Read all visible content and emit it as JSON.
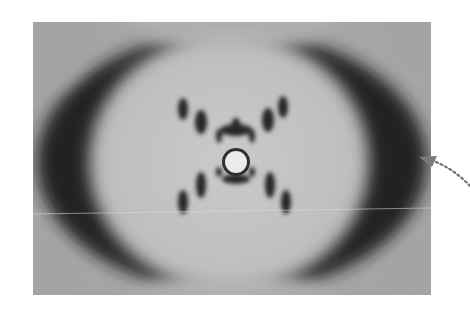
{
  "figure": {
    "style": "grayscale photograph",
    "colors": {
      "background": "#ffffff",
      "film_gray": "#a9a9a9",
      "center_light": "#c9c9c9",
      "dark_arcs": "#1a1a1a",
      "spots": "#222222",
      "arrow": "#777777"
    }
  },
  "annotation": {
    "arrow": "dotted-curved-arrow",
    "points_to": "right dark arc"
  }
}
